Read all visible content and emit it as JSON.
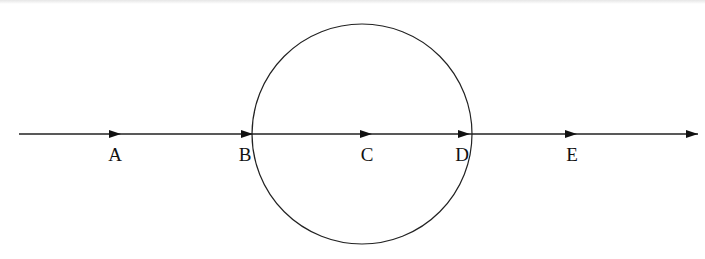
{
  "diagram": {
    "type": "ray-through-circle",
    "colors": {
      "stroke": "#222222",
      "background": "#ffffff"
    },
    "line": {
      "x_start": 19,
      "x_end": 698,
      "y": 134,
      "end_arrow": true
    },
    "circle": {
      "cx": 362,
      "cy": 134,
      "r": 110
    },
    "points": [
      {
        "label": "A",
        "arrow_x": 121,
        "label_x": 115
      },
      {
        "label": "B",
        "arrow_x": 253,
        "label_x": 245
      },
      {
        "label": "C",
        "arrow_x": 372,
        "label_x": 367
      },
      {
        "label": "D",
        "arrow_x": 470,
        "label_x": 462
      },
      {
        "label": "E",
        "arrow_x": 577,
        "label_x": 572
      }
    ],
    "label_y": 161
  }
}
